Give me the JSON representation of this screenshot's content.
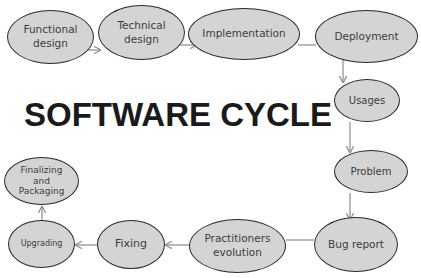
{
  "title": "SOFTWARE CYCLE",
  "colors": {
    "node_fill": "#d4d4d4",
    "node_border": "#2a2a2a",
    "text": "#3c3c3c",
    "edge": "#8a8a8a"
  },
  "nodes": [
    {
      "id": "functional-design",
      "label": "Functional\ndesign"
    },
    {
      "id": "technical-design",
      "label": "Technical\ndesign"
    },
    {
      "id": "implementation",
      "label": "Implementation"
    },
    {
      "id": "deployment",
      "label": "Deployment"
    },
    {
      "id": "usages",
      "label": "Usages"
    },
    {
      "id": "problem",
      "label": "Problem"
    },
    {
      "id": "bug-report",
      "label": "Bug report"
    },
    {
      "id": "practitioners-evolution",
      "label": "Practitioners\nevolution"
    },
    {
      "id": "fixing",
      "label": "Fixing"
    },
    {
      "id": "upgrading",
      "label": "Upgrading"
    },
    {
      "id": "finalizing-and-packaging",
      "label": "Finalizing\nand\nPackaging"
    }
  ],
  "edges": [
    [
      "functional-design",
      "technical-design"
    ],
    [
      "technical-design",
      "implementation"
    ],
    [
      "implementation",
      "deployment"
    ],
    [
      "deployment",
      "usages"
    ],
    [
      "usages",
      "problem"
    ],
    [
      "problem",
      "bug-report"
    ],
    [
      "bug-report",
      "practitioners-evolution"
    ],
    [
      "practitioners-evolution",
      "fixing"
    ],
    [
      "fixing",
      "upgrading"
    ],
    [
      "upgrading",
      "finalizing-and-packaging"
    ]
  ]
}
